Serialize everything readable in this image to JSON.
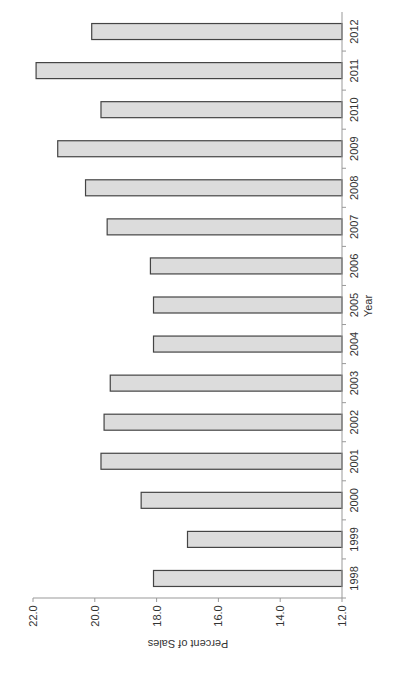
{
  "chart_data": {
    "type": "bar",
    "orientation": "horizontal (page rotated 90°)",
    "title": "",
    "xlabel": "Year",
    "ylabel": "Percent of Sales",
    "categories": [
      "1998",
      "1999",
      "2000",
      "2001",
      "2002",
      "2003",
      "2004",
      "2005",
      "2006",
      "2007",
      "2008",
      "2009",
      "2010",
      "2011",
      "2012"
    ],
    "values": [
      18.1,
      17.0,
      18.5,
      19.8,
      19.7,
      19.5,
      18.1,
      18.1,
      18.2,
      19.6,
      20.3,
      21.2,
      19.8,
      21.9,
      20.1
    ],
    "ylim": [
      12.0,
      22.0
    ],
    "yticks": [
      "12.0",
      "14.0",
      "16.0",
      "18.0",
      "20.0",
      "22.0"
    ],
    "grid": false,
    "legend": null,
    "colors": {
      "bar_fill": "#dcdcdc",
      "bar_stroke": "#444444",
      "axis": "#999999"
    }
  }
}
